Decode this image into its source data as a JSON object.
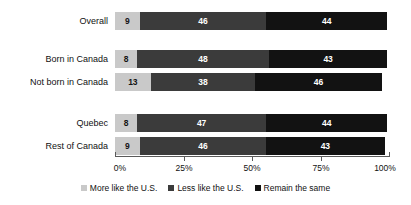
{
  "chart_data": {
    "type": "bar",
    "title": "",
    "subtitle": "",
    "xlabel": "",
    "ylabel": "",
    "orientation": "horizontal",
    "stacked": true,
    "stack_mode": "percent",
    "grid": false,
    "legend_position": "bottom",
    "xlim": [
      0,
      100
    ],
    "x_ticks": [
      0,
      25,
      50,
      75,
      100
    ],
    "x_tick_labels": [
      "0%",
      "25%",
      "50%",
      "75%",
      "100%"
    ],
    "categories": [
      "Overall",
      "Born in Canada",
      "Not born in Canada",
      "Quebec",
      "Rest of Canada"
    ],
    "series": [
      {
        "name": "More like the U.S.",
        "color": "#c9c9c9",
        "values": [
          9,
          8,
          13,
          8,
          9
        ]
      },
      {
        "name": "Less like the U.S.",
        "color": "#3b3b3b",
        "values": [
          46,
          48,
          38,
          47,
          46
        ]
      },
      {
        "name": "Remain the same",
        "color": "#121212",
        "values": [
          44,
          43,
          46,
          44,
          43
        ]
      }
    ],
    "rows": [
      {
        "label": "Overall",
        "segments": [
          {
            "series": "More like the U.S.",
            "value": 9,
            "label": "9"
          },
          {
            "series": "Less like the U.S.",
            "value": 46,
            "label": "46"
          },
          {
            "series": "Remain the same",
            "value": 44,
            "label": "44"
          }
        ]
      },
      {
        "label": "Born in Canada",
        "segments": [
          {
            "series": "More like the U.S.",
            "value": 8,
            "label": "8"
          },
          {
            "series": "Less like the U.S.",
            "value": 48,
            "label": "48"
          },
          {
            "series": "Remain the same",
            "value": 43,
            "label": "43"
          }
        ]
      },
      {
        "label": "Not born in Canada",
        "segments": [
          {
            "series": "More like the U.S.",
            "value": 13,
            "label": "13"
          },
          {
            "series": "Less like the U.S.",
            "value": 38,
            "label": "38"
          },
          {
            "series": "Remain the same",
            "value": 46,
            "label": "46"
          }
        ]
      },
      {
        "label": "Quebec",
        "segments": [
          {
            "series": "More like the U.S.",
            "value": 8,
            "label": "8"
          },
          {
            "series": "Less like the U.S.",
            "value": 47,
            "label": "47"
          },
          {
            "series": "Remain the same",
            "value": 44,
            "label": "44"
          }
        ]
      },
      {
        "label": "Rest of Canada",
        "segments": [
          {
            "series": "More like the U.S.",
            "value": 9,
            "label": "9"
          },
          {
            "series": "Less like the U.S.",
            "value": 46,
            "label": "46"
          },
          {
            "series": "Remain the same",
            "value": 43,
            "label": "43"
          }
        ]
      }
    ],
    "legend": [
      {
        "label": "More like the U.S.",
        "color": "#c9c9c9"
      },
      {
        "label": "Less like the U.S.",
        "color": "#3b3b3b"
      },
      {
        "label": "Remain the same",
        "color": "#121212"
      }
    ]
  }
}
